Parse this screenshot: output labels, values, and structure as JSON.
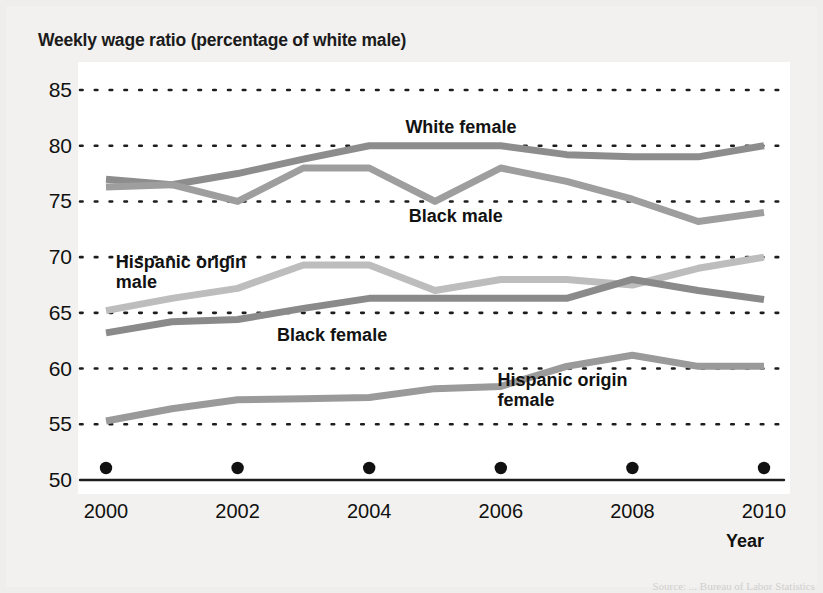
{
  "chart_data": {
    "type": "line",
    "title": "Weekly wage ratio (percentage of white male)",
    "xlabel": "Year",
    "ylabel": "",
    "xlim": [
      2000,
      2010
    ],
    "ylim": [
      50,
      85
    ],
    "ytick_labels": [
      "85",
      "80",
      "75",
      "70",
      "65",
      "60",
      "55",
      "50"
    ],
    "yticks": [
      85,
      80,
      75,
      70,
      65,
      60,
      55,
      50
    ],
    "xtick_labels": [
      "2000",
      "2002",
      "2004",
      "2006",
      "2008",
      "2010"
    ],
    "xticks": [
      2000,
      2002,
      2004,
      2006,
      2008,
      2010
    ],
    "x": [
      2000,
      2001,
      2002,
      2003,
      2004,
      2005,
      2006,
      2007,
      2008,
      2009,
      2010
    ],
    "grid": "horizontal-dotted",
    "legend_position": "inline-annotations",
    "series": [
      {
        "name": "White female",
        "color": "#8d8d8d",
        "values": [
          77.0,
          76.5,
          77.5,
          78.8,
          80.0,
          80.0,
          80.0,
          79.2,
          79.0,
          79.0,
          80.0
        ]
      },
      {
        "name": "Black male",
        "color": "#9e9e9e",
        "values": [
          76.3,
          76.5,
          75.0,
          78.0,
          78.0,
          75.0,
          78.0,
          76.8,
          75.2,
          73.2,
          74.0
        ]
      },
      {
        "name": "Hispanic origin male",
        "color": "#bdbdbd",
        "values": [
          65.2,
          66.3,
          67.2,
          69.3,
          69.3,
          67.0,
          68.0,
          68.0,
          67.5,
          69.0,
          70.0
        ]
      },
      {
        "name": "Black female",
        "color": "#8a8a8a",
        "values": [
          63.2,
          64.2,
          64.4,
          65.4,
          66.3,
          66.3,
          66.3,
          66.3,
          68.0,
          67.0,
          66.2
        ]
      },
      {
        "name": "Hispanic origin female",
        "color": "#9a9a9a",
        "values": [
          55.3,
          56.4,
          57.2,
          57.3,
          57.4,
          58.2,
          58.4,
          60.2,
          61.2,
          60.2,
          60.2
        ]
      }
    ],
    "annotations": [
      {
        "text": "White female",
        "x": 2004.55,
        "y": 81.6
      },
      {
        "text": "Black male",
        "x": 2004.6,
        "y": 73.6
      },
      {
        "text": "Hispanic origin\nmale",
        "x": 2000.15,
        "y": 69.5
      },
      {
        "text": "Black female",
        "x": 2002.6,
        "y": 62.9
      },
      {
        "text": "Hispanic origin\nfemale",
        "x": 2005.95,
        "y": 58.9
      }
    ],
    "x_axis_markers": {
      "shape": "filled-circle",
      "color": "#111111",
      "y": 50,
      "x": [
        2000,
        2002,
        2004,
        2006,
        2008,
        2010
      ]
    }
  },
  "source_note": "Source:  ...  Bureau of Labor Statistics"
}
